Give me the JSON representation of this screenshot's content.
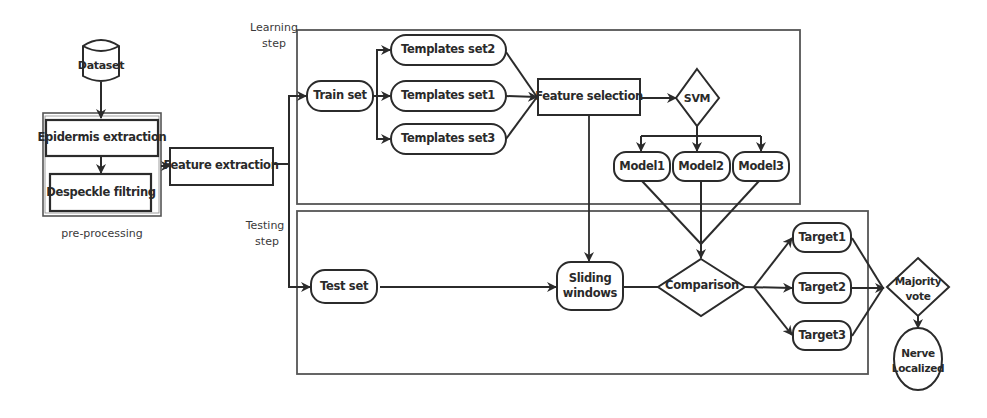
{
  "diagram": {
    "type": "flowchart",
    "groups": {
      "learning": {
        "label_line1": "Learning",
        "label_line2": "step"
      },
      "testing": {
        "label_line1": "Testing",
        "label_line2": "step"
      },
      "preprocessing": {
        "label": "pre-processing"
      }
    },
    "nodes": {
      "dataset": "Dataset",
      "epidermis": "Epidermis extraction",
      "despeckle": "Despeckle filtring",
      "feature_extraction": "Feature extraction",
      "train_set": "Train set",
      "templates_set2": "Templates set2",
      "templates_set1": "Templates set1",
      "templates_set3": "Templates set3",
      "feature_selection": "Feature selection",
      "svm": "SVM",
      "model1": "Model1",
      "model2": "Model2",
      "model3": "Model3",
      "test_set": "Test set",
      "sliding_line1": "Sliding",
      "sliding_line2": "windows",
      "comparison": "Comparison",
      "target1": "Target1",
      "target2": "Target2",
      "target3": "Target3",
      "majority_line1": "Majority",
      "majority_line2": "vote",
      "nerve_line1": "Nerve",
      "nerve_line2": "Localized"
    },
    "edges": [
      [
        "Dataset",
        "Epidermis extraction"
      ],
      [
        "Epidermis extraction",
        "Despeckle filtring"
      ],
      [
        "pre-processing",
        "Feature extraction"
      ],
      [
        "Feature extraction",
        "Train set"
      ],
      [
        "Feature extraction",
        "Test set"
      ],
      [
        "Train set",
        "Templates set2"
      ],
      [
        "Train set",
        "Templates set1"
      ],
      [
        "Train set",
        "Templates set3"
      ],
      [
        "Templates set2",
        "Feature selection"
      ],
      [
        "Templates set1",
        "Feature selection"
      ],
      [
        "Templates set3",
        "Feature selection"
      ],
      [
        "Feature selection",
        "SVM"
      ],
      [
        "Feature selection",
        "Sliding windows"
      ],
      [
        "SVM",
        "Model1"
      ],
      [
        "SVM",
        "Model2"
      ],
      [
        "SVM",
        "Model3"
      ],
      [
        "Model1",
        "Comparison"
      ],
      [
        "Model2",
        "Comparison"
      ],
      [
        "Model3",
        "Comparison"
      ],
      [
        "Test set",
        "Sliding windows"
      ],
      [
        "Sliding windows",
        "Comparison"
      ],
      [
        "Comparison",
        "Target1"
      ],
      [
        "Comparison",
        "Target2"
      ],
      [
        "Comparison",
        "Target3"
      ],
      [
        "Target1",
        "Majority vote"
      ],
      [
        "Target2",
        "Majority vote"
      ],
      [
        "Target3",
        "Majority vote"
      ],
      [
        "Majority vote",
        "Nerve Localized"
      ]
    ],
    "colors": {
      "stroke": "#2b2b2b",
      "group_border": "#555555",
      "background": "#ffffff"
    }
  }
}
